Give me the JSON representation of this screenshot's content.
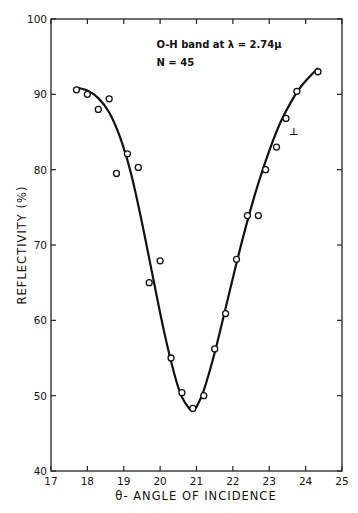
{
  "chart_data": {
    "type": "scatter",
    "title": "",
    "xlabel": "θ- ANGLE OF INCIDENCE",
    "ylabel": "REFLECTIVITY (%)",
    "xlim": [
      17,
      25
    ],
    "ylim": [
      40,
      100
    ],
    "xticks": [
      17,
      18,
      19,
      20,
      21,
      22,
      23,
      24,
      25
    ],
    "yticks": [
      40,
      50,
      60,
      70,
      80,
      90,
      100
    ],
    "grid": false,
    "legend": null,
    "annotations": [
      {
        "text": "O-H band at λ = 2.74μ",
        "x": 19.9,
        "y": 96.2
      },
      {
        "text": "N = 45",
        "x": 19.9,
        "y": 93.7
      },
      {
        "text": "⊥",
        "x": 23.55,
        "y": 84.6
      }
    ],
    "series": [
      {
        "name": "measured",
        "marker": "open-circle",
        "x": [
          17.7,
          18.0,
          18.3,
          18.6,
          18.8,
          19.1,
          19.4,
          19.7,
          20.0,
          20.3,
          20.6,
          20.9,
          21.2,
          21.5,
          21.8,
          22.1,
          22.4,
          22.7,
          22.9,
          23.2,
          23.46,
          23.76,
          24.34
        ],
        "y": [
          90.6,
          90.0,
          88.0,
          89.4,
          79.5,
          82.1,
          80.3,
          65.0,
          67.9,
          55.0,
          50.4,
          48.3,
          50.0,
          56.2,
          60.9,
          68.1,
          73.9,
          73.9,
          80.0,
          83.0,
          86.8,
          90.4,
          93.0
        ]
      },
      {
        "name": "fitted curve",
        "marker": "line",
        "x": [
          17.7,
          18.0,
          18.3,
          18.6,
          18.9,
          19.2,
          19.5,
          19.8,
          20.1,
          20.4,
          20.6,
          20.8,
          20.9,
          21.0,
          21.2,
          21.5,
          21.8,
          22.1,
          22.4,
          22.7,
          23.0,
          23.3,
          23.6,
          23.9,
          24.34
        ],
        "y": [
          90.9,
          90.5,
          89.5,
          87.6,
          84.3,
          79.5,
          73.0,
          65.8,
          58.7,
          52.7,
          49.8,
          48.3,
          48.1,
          48.5,
          50.7,
          55.7,
          61.6,
          67.6,
          73.2,
          78.2,
          82.5,
          86.2,
          89.0,
          91.2,
          93.5
        ]
      }
    ]
  }
}
